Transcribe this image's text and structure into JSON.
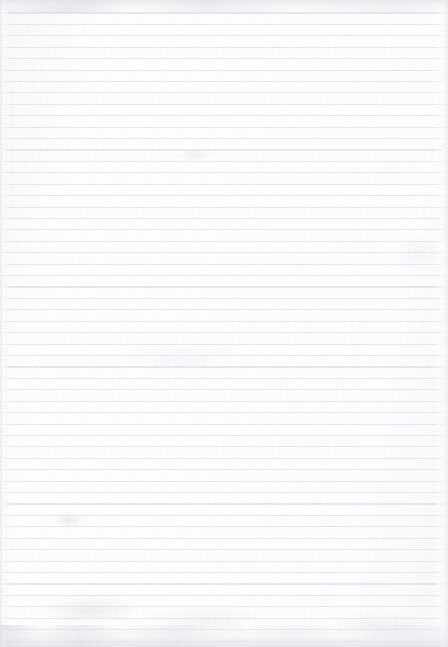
{
  "document": {
    "type": "scanned-page",
    "title": "Blank ruled notebook paper",
    "description": "A scan of an empty, lined sheet of paper with no handwriting, printed text, headings, or markings of any kind.",
    "text_content": "",
    "visible_text_items": [],
    "page_number": "",
    "orientation": "portrait"
  },
  "paper": {
    "width_px": 448,
    "height_px": 647,
    "background_color": "#fdfdfe",
    "rule_line_color": "#dfe2e9",
    "margin_rule_color": "#ebecf1",
    "edge_shadow_color": "#dedfe4",
    "rule_spacing_px": 11.4,
    "rule_count": 55,
    "first_rule_y_px": 13,
    "rule_left_px": 3,
    "rule_right_px": 443,
    "margin_rule_x_px": 6,
    "has_vertical_margin_rule": true,
    "has_holes": false,
    "has_handwriting": false
  },
  "artifacts": {
    "top_edge_band": "grey scan smudge along the top edge",
    "bottom_edge_band": "grey mottled smudge along the bottom edge",
    "smudges": [
      {
        "name": "smudge-top-left",
        "x": 52,
        "y": 0,
        "w": 64,
        "h": 12
      },
      {
        "name": "smudge-top-mid",
        "x": 176,
        "y": 0,
        "w": 52,
        "h": 12
      },
      {
        "name": "smudge-upper",
        "x": 176,
        "y": 148,
        "w": 40,
        "h": 14
      },
      {
        "name": "smudge-mid-left",
        "x": 54,
        "y": 512,
        "w": 30,
        "h": 16
      },
      {
        "name": "smudge-low-left",
        "x": 42,
        "y": 596,
        "w": 96,
        "h": 28
      },
      {
        "name": "smudge-low-mid",
        "x": 150,
        "y": 604,
        "w": 110,
        "h": 30
      },
      {
        "name": "smudge-bottom-right",
        "x": 330,
        "y": 612,
        "w": 100,
        "h": 26
      },
      {
        "name": "smudge-right-mid",
        "x": 398,
        "y": 236,
        "w": 44,
        "h": 34
      },
      {
        "name": "smudge-center",
        "x": 120,
        "y": 344,
        "w": 120,
        "h": 26
      }
    ]
  }
}
